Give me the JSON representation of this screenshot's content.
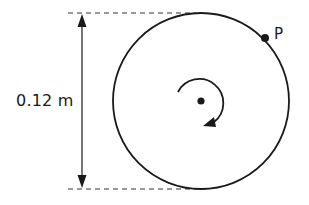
{
  "diagram": {
    "type": "rotating-disc",
    "dimension_label": "0.12 m",
    "point_label": "P",
    "rotation_direction": "clockwise",
    "elements": {
      "disc": "circle",
      "center": "center-dot",
      "point": "point-p-dot",
      "rotation_indicator": "clockwise-arrow-icon",
      "dimension": "diameter-double-arrow",
      "guides": [
        "top-dashed-guide",
        "bottom-dashed-guide"
      ]
    },
    "colors": {
      "stroke": "#1a1a1a",
      "background": "#ffffff"
    }
  }
}
